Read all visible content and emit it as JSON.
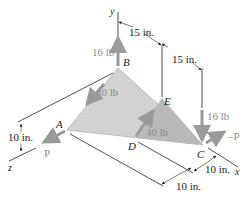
{
  "diagram": {
    "colors": {
      "plate_fill": "#cfcfcf",
      "plate_edge": "#a8a8a8",
      "force_arrow": "#9a9a9a",
      "force_label": "#8a8a8a",
      "line": "#222222"
    },
    "axes": {
      "y": "y",
      "z": "z",
      "x": "x"
    },
    "points": {
      "A": "A",
      "B": "B",
      "C": "C",
      "D": "D",
      "E": "E"
    },
    "forces": {
      "at_B": "16 lb",
      "along_BA": "40 lb",
      "at_D": "40 lb",
      "at_C": "16 lb",
      "at_A": "P",
      "at_C_P": "–P"
    },
    "dimensions": {
      "top_1": "15 in.",
      "top_2": "15 in.",
      "left_height": "10 in.",
      "bottom_right_1": "10 in.",
      "bottom_right_2": "10 in."
    }
  }
}
